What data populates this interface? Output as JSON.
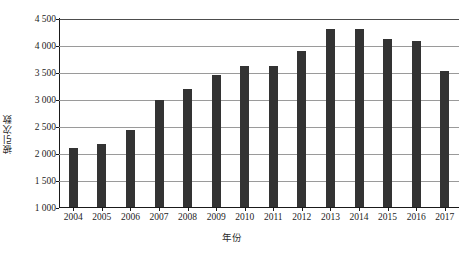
{
  "chart_data": {
    "type": "bar",
    "title": "",
    "xlabel": "年份",
    "ylabel": "被引次数",
    "categories": [
      "2004",
      "2005",
      "2006",
      "2007",
      "2008",
      "2009",
      "2010",
      "2011",
      "2012",
      "2013",
      "2014",
      "2015",
      "2016",
      "2017"
    ],
    "values": [
      2100,
      2170,
      2430,
      2990,
      3190,
      3440,
      3620,
      3620,
      3890,
      4290,
      4290,
      4110,
      4070,
      3520
    ],
    "ylim": [
      1000,
      4500
    ],
    "ytick_values": [
      1000,
      1500,
      2000,
      2500,
      3000,
      3500,
      4000,
      4500
    ],
    "ytick_labels": [
      "1 000",
      "1 500",
      "2 000",
      "2 500",
      "3 000",
      "3 500",
      "4 000",
      "4 500"
    ],
    "grid": true,
    "legend": "none",
    "bar_color": "#333333",
    "gridline_color": "#9a9a9a",
    "axis_color": "#1a1a1a"
  }
}
